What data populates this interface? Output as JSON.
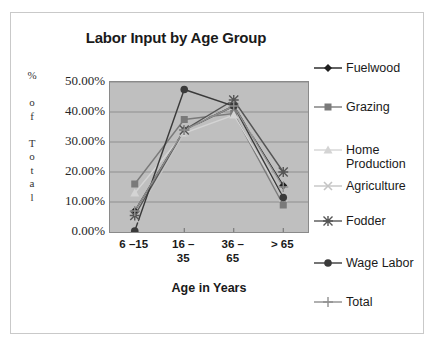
{
  "chart_data": {
    "type": "line",
    "title": "Labor Input by Age Group",
    "xlabel": "Age in Years",
    "ylabel": "% of Total",
    "ylabel_stacked": "%\n\no\nf\n\nT\no\nt\na\nl",
    "categories": [
      "6 –15",
      "16 – 35",
      "36 – 65",
      "> 65"
    ],
    "categories_lines": [
      [
        "6 –15"
      ],
      [
        "16 –",
        "35"
      ],
      [
        "36 –",
        "65"
      ],
      [
        "> 65"
      ]
    ],
    "ylim": [
      0,
      50
    ],
    "ytick_labels": [
      "50.00%",
      "40.00%",
      "30.00%",
      "20.00%",
      "10.00%",
      "0.00%"
    ],
    "ytick_values": [
      50,
      40,
      30,
      20,
      10,
      0
    ],
    "grid": true,
    "grid_axis": "y",
    "legend_position": "right",
    "plot_bgcolor": "#bfbfbf",
    "series": [
      {
        "name": "Fuelwood",
        "marker": "diamond",
        "color": "#1f1f1f",
        "values": [
          7.0,
          34.0,
          42.0,
          15.5
        ]
      },
      {
        "name": "Grazing",
        "marker": "square",
        "color": "#7a7a7a",
        "values": [
          16.0,
          37.5,
          39.5,
          9.0
        ]
      },
      {
        "name": "Home Production",
        "marker": "triangle",
        "color": "#d4d4d4",
        "values": [
          13.0,
          33.0,
          39.0,
          11.5
        ]
      },
      {
        "name": "Agriculture",
        "marker": "x",
        "color": "#c4c4c4",
        "values": [
          4.5,
          33.0,
          44.5,
          11.5
        ]
      },
      {
        "name": "Fodder",
        "marker": "star",
        "color": "#555555",
        "values": [
          5.5,
          34.0,
          44.0,
          20.0
        ]
      },
      {
        "name": "Wage Labor",
        "marker": "circle",
        "color": "#3a3a3a",
        "values": [
          0.3,
          47.5,
          42.0,
          11.5
        ]
      },
      {
        "name": "Total",
        "marker": "plus",
        "color": "#8f8f8f",
        "values": [
          7.0,
          34.0,
          42.0,
          15.0
        ]
      }
    ]
  },
  "legend": {
    "items": [
      {
        "label": "Fuelwood",
        "marker": "diamond",
        "color": "#1f1f1f"
      },
      {
        "label": "Grazing",
        "marker": "square",
        "color": "#7a7a7a"
      },
      {
        "label": "Home\nProduction",
        "marker": "triangle",
        "color": "#d4d4d4"
      },
      {
        "label": "Agriculture",
        "marker": "x",
        "color": "#c4c4c4"
      },
      {
        "label": "Fodder",
        "marker": "star",
        "color": "#555555"
      },
      {
        "label": "Wage Labor",
        "marker": "circle",
        "color": "#3a3a3a"
      },
      {
        "label": "Total",
        "marker": "plus",
        "color": "#8f8f8f"
      }
    ]
  }
}
